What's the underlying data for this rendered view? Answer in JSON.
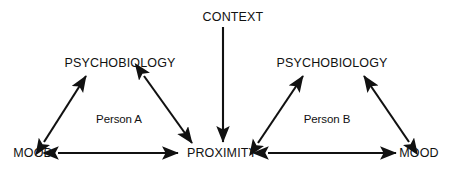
{
  "diagram": {
    "background_color": "#ffffff",
    "ink_color": "#111111",
    "nodes": [
      {
        "id": "context",
        "label": "CONTEXT",
        "x": 233,
        "y": 17,
        "style": "caps"
      },
      {
        "id": "psychobiology-a",
        "label": "PSYCHOBIOLOGY",
        "x": 120,
        "y": 63,
        "style": "caps"
      },
      {
        "id": "psychobiology-b",
        "label": "PSYCHOBIOLOGY",
        "x": 332,
        "y": 63,
        "style": "caps"
      },
      {
        "id": "mood-a",
        "label": "MOOD",
        "x": 33,
        "y": 153,
        "style": "caps"
      },
      {
        "id": "proximity",
        "label": "PROXIMITY",
        "x": 222,
        "y": 153,
        "style": "caps"
      },
      {
        "id": "mood-b",
        "label": "MOOD",
        "x": 419,
        "y": 153,
        "style": "caps"
      }
    ],
    "group_labels": [
      {
        "id": "person-a",
        "label": "Person A",
        "x": 119,
        "y": 120
      },
      {
        "id": "person-b",
        "label": "Person B",
        "x": 327,
        "y": 120
      }
    ],
    "edges": [
      {
        "id": "context-to-proximity",
        "from": "context",
        "to": "proximity",
        "arrows": "single",
        "x1": 223,
        "y1": 27,
        "x2": 223,
        "y2": 142
      },
      {
        "id": "mood-a-psychobiology-a",
        "from": "mood-a",
        "to": "psychobiology-a",
        "arrows": "double",
        "x1": 44,
        "y1": 142,
        "x2": 86,
        "y2": 76
      },
      {
        "id": "psychobiology-a-proximity",
        "from": "psychobiology-a",
        "to": "proximity",
        "arrows": "double",
        "x1": 144,
        "y1": 76,
        "x2": 192,
        "y2": 143
      },
      {
        "id": "mood-a-proximity",
        "from": "mood-a",
        "to": "proximity",
        "arrows": "double",
        "x1": 58,
        "y1": 153,
        "x2": 178,
        "y2": 153
      },
      {
        "id": "proximity-psychobiology-b",
        "from": "proximity",
        "to": "psychobiology-b",
        "arrows": "double",
        "x1": 258,
        "y1": 143,
        "x2": 303,
        "y2": 76
      },
      {
        "id": "mood-b-psychobiology-b",
        "from": "mood-b",
        "to": "psychobiology-b",
        "arrows": "double",
        "x1": 409,
        "y1": 142,
        "x2": 364,
        "y2": 76
      },
      {
        "id": "proximity-mood-b",
        "from": "proximity",
        "to": "mood-b",
        "arrows": "double",
        "x1": 268,
        "y1": 153,
        "x2": 396,
        "y2": 153
      }
    ]
  }
}
